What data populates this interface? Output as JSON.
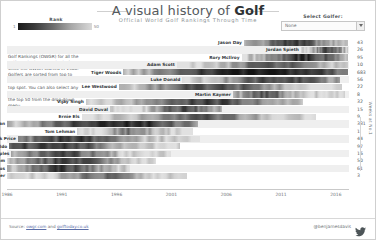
{
  "header": {
    "title_prefix": "A visual history of ",
    "title_emphasis": "Golf",
    "subtitle": "Official World Golf Rankings Through Time"
  },
  "legend": {
    "title": "Rank",
    "min": "1",
    "max": "50",
    "color_dark": "#1b1b1b",
    "color_light": "#d9d9d9"
  },
  "selector": {
    "label": "Select Golfer:",
    "value": "None",
    "arrow_icon": "chevron-down-icon"
  },
  "blurb": {
    "lead": "This chart",
    "body": " shows Official World Golf Rankings (OWGR) for all the golfers who have reached Nº1 since the OWGR started in 1986. Golfers are sorted from top to bottom by how recently they hit top spot. You can also select any golfer that has ever appeared in the top 50 from the drop down menu."
  },
  "footer": {
    "source_prefix": "Source: ",
    "source_link_1": "owgr.com",
    "source_joiner": " and ",
    "source_link_2": "golftoday.co.uk",
    "handle": "@benjamesdavis",
    "twitter_icon": "twitter-bird-icon"
  },
  "chart_data": {
    "type": "heatmap",
    "title": "A visual history of Golf",
    "subtitle": "Official World Golf Rankings Through Time",
    "xlabel": "",
    "ylabel": "Weeks at No.1",
    "xlim": [
      1986,
      2017.2
    ],
    "grid": false,
    "legend": "Rank (1 dark → 50 light)",
    "tick_labels": [
      "1986",
      "1991",
      "1996",
      "2001",
      "2006",
      "2011",
      "2016"
    ],
    "tick_values": [
      1986,
      1991,
      1996,
      2001,
      2006,
      2011,
      2016
    ],
    "value_column_header": "Weeks at No.1",
    "categories": [
      "Jason Day",
      "Jordan Spieth",
      "Rory McIlroy",
      "Adam Scott",
      "Tiger Woods",
      "Luke Donald",
      "Lee Westwood",
      "Martin Kaymer",
      "Vijay Singh",
      "David Duval",
      "Ernie Els",
      "Greg Norman",
      "Tom Lehman",
      "Nick Price",
      "Nick Faldo",
      "Fred Couples",
      "Ian Woosnam",
      "Seve Ballesteros",
      "Bernhard Langer"
    ],
    "values": [
      43,
      26,
      95,
      10,
      683,
      56,
      22,
      8,
      32,
      15,
      9,
      331,
      1,
      44,
      97,
      16,
      50,
      61,
      3
    ],
    "series": [
      {
        "name": "Jason Day",
        "start": 2007.6,
        "end": 2017.1,
        "weeks": 43
      },
      {
        "name": "Jordan Spieth",
        "start": 2012.8,
        "end": 2017.1,
        "weeks": 26
      },
      {
        "name": "Rory McIlroy",
        "start": 2007.4,
        "end": 2017.1,
        "weeks": 95
      },
      {
        "name": "Adam Scott",
        "start": 2001.5,
        "end": 2017.1,
        "weeks": 10
      },
      {
        "name": "Tiger Woods",
        "start": 1996.6,
        "end": 2017.1,
        "weeks": 683
      },
      {
        "name": "Luke Donald",
        "start": 2002.0,
        "end": 2016.4,
        "weeks": 56
      },
      {
        "name": "Lee Westwood",
        "start": 1996.2,
        "end": 2016.6,
        "weeks": 22
      },
      {
        "name": "Martin Kaymer",
        "start": 2006.6,
        "end": 2016.8,
        "weeks": 8
      },
      {
        "name": "Vijay Singh",
        "start": 1993.2,
        "end": 2013.0,
        "weeks": 32
      },
      {
        "name": "David Duval",
        "start": 1995.4,
        "end": 2005.6,
        "weeks": 15
      },
      {
        "name": "Ernie Els",
        "start": 1992.8,
        "end": 2014.2,
        "weeks": 9
      },
      {
        "name": "Greg Norman",
        "start": 1986.0,
        "end": 2003.4,
        "weeks": 331
      },
      {
        "name": "Tom Lehman",
        "start": 1992.4,
        "end": 2003.0,
        "weeks": 1
      },
      {
        "name": "Nick Price",
        "start": 1987.0,
        "end": 2003.6,
        "weeks": 44
      },
      {
        "name": "Nick Faldo",
        "start": 1986.2,
        "end": 2001.8,
        "weeks": 97
      },
      {
        "name": "Fred Couples",
        "start": 1986.4,
        "end": 2001.0,
        "weeks": 16
      },
      {
        "name": "Ian Woosnam",
        "start": 1986.0,
        "end": 1999.6,
        "weeks": 50
      },
      {
        "name": "Seve Ballesteros",
        "start": 1986.0,
        "end": 1997.2,
        "weeks": 61
      },
      {
        "name": "Bernhard Langer",
        "start": 1986.0,
        "end": 2002.4,
        "weeks": 3
      }
    ]
  }
}
